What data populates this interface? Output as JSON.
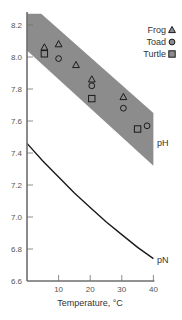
{
  "chart_data": {
    "type": "scatter",
    "title": "",
    "xlabel": "Temperature, °C",
    "ylabel": "",
    "xlim": [
      0,
      40
    ],
    "ylim": [
      6.6,
      8.3
    ],
    "xticks": [
      10,
      20,
      30,
      40
    ],
    "xtick_labels": [
      "10",
      "20",
      "30",
      "40"
    ],
    "yticks": [
      6.6,
      6.8,
      7.0,
      7.2,
      7.4,
      7.6,
      7.8,
      8.0,
      8.2
    ],
    "ytick_labels": [
      "6.6",
      "6.8",
      "7.0",
      "7.2",
      "7.4",
      "7.6",
      "7.8",
      "8.0",
      "8.2"
    ],
    "grid": false,
    "legend_position": "upper right",
    "series": [
      {
        "name": "Frog",
        "marker": "triangle",
        "points": [
          [
            5.5,
            8.06
          ],
          [
            10,
            8.08
          ],
          [
            15.5,
            7.95
          ],
          [
            20.5,
            7.86
          ],
          [
            30.5,
            7.75
          ]
        ]
      },
      {
        "name": "Toad",
        "marker": "circle",
        "points": [
          [
            10,
            7.99
          ],
          [
            20.5,
            7.82
          ],
          [
            30.5,
            7.68
          ],
          [
            38,
            7.57
          ]
        ]
      },
      {
        "name": "Turtle",
        "marker": "square",
        "points": [
          [
            5.5,
            8.02
          ],
          [
            20.5,
            7.74
          ],
          [
            35,
            7.55
          ]
        ]
      }
    ],
    "bands": [
      {
        "name": "pH",
        "label": "pH",
        "color": "#8c8c8c",
        "upper": [
          [
            0,
            8.27
          ],
          [
            4.5,
            8.27
          ],
          [
            40,
            7.65
          ]
        ],
        "lower": [
          [
            0,
            8.04
          ],
          [
            40,
            7.32
          ]
        ]
      }
    ],
    "lines": [
      {
        "name": "pN",
        "label": "pN",
        "points": [
          [
            0,
            7.46
          ],
          [
            5,
            7.35
          ],
          [
            10,
            7.25
          ],
          [
            15,
            7.15
          ],
          [
            20,
            7.06
          ],
          [
            25,
            6.97
          ],
          [
            30,
            6.89
          ],
          [
            35,
            6.81
          ],
          [
            40,
            6.74
          ]
        ]
      }
    ]
  },
  "legend": {
    "items": [
      {
        "label": "Frog",
        "symbol": "triangle-icon"
      },
      {
        "label": "Toad",
        "symbol": "circle-icon"
      },
      {
        "label": "Turtle",
        "symbol": "square-icon"
      }
    ]
  },
  "labels": {
    "ph": "pH",
    "pn": "pN",
    "x_axis": "Temperature, °C"
  },
  "colors": {
    "band": "#8c8c8c",
    "axis": "#6e6e6e",
    "line": "#1a1a1a",
    "marker_stroke": "#1a1a1a"
  }
}
